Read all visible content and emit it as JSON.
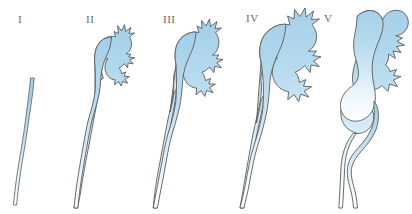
{
  "figure": {
    "background_color": "#ffffff",
    "outline_color": "#5a5a5a",
    "fill_color_top": "#a9d2ea",
    "fill_color_bottom": "#ffffff",
    "label_color": "#6b6b6b",
    "stages": [
      {
        "label": "I",
        "label_x": 18,
        "label_y": 14,
        "name": "grade-1",
        "description": "Slender non-dilated ureter only; no calyceal dilation"
      },
      {
        "label": "II",
        "label_x": 86,
        "label_y": 14,
        "name": "grade-2",
        "description": "Mild pelvic dilation with small sharp spiky calyces"
      },
      {
        "label": "III",
        "label_x": 163,
        "label_y": 14,
        "name": "grade-3",
        "description": "Moderate dilation of renal pelvis and calyces"
      },
      {
        "label": "IV",
        "label_x": 246,
        "label_y": 13,
        "name": "grade-4",
        "description": "Marked dilation with blunted rounded calyces"
      },
      {
        "label": "V",
        "label_x": 324,
        "label_y": 13,
        "name": "grade-5",
        "description": "Severe ballooned pelvicalyceal dilation with tortuous dilated ureter"
      }
    ]
  }
}
